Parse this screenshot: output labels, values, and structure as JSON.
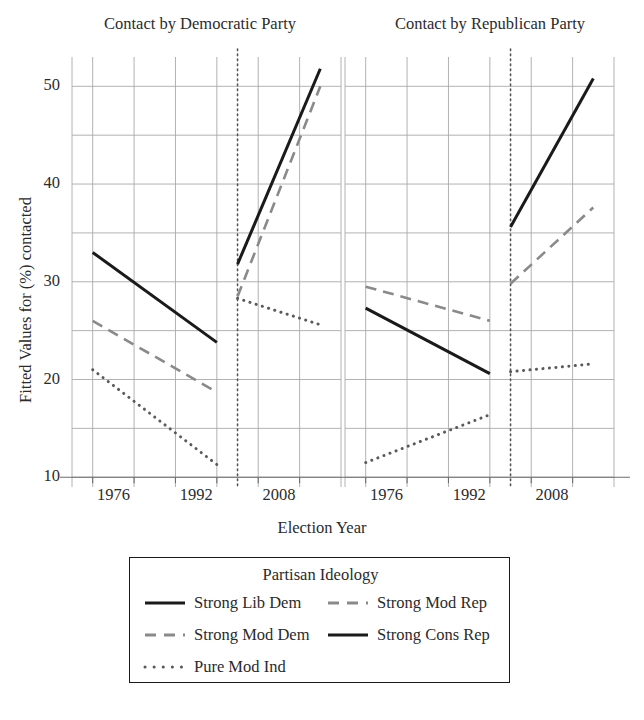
{
  "figure": {
    "panel_titles": [
      "Contact by Democratic Party",
      "Contact by Republican Party"
    ],
    "xlabel": "Election Year",
    "ylabel": "Fitted Values for (%) contacted",
    "ytick_labels": [
      "10",
      "20",
      "30",
      "40",
      "50"
    ],
    "xtick_labels_left": [
      "1976",
      "1992",
      "2008"
    ],
    "xtick_labels_right": [
      "1976",
      "1992",
      "2008"
    ]
  },
  "legend": {
    "title": "Partisan Ideology",
    "items": [
      {
        "label": "Strong Lib Dem",
        "style": "solid",
        "color": "#1a1a1a"
      },
      {
        "label": "Strong Mod Dem",
        "style": "dashed",
        "color": "#8a8a8a"
      },
      {
        "label": "Pure Mod Ind",
        "style": "dotted",
        "color": "#5a5a5a"
      },
      {
        "label": "Strong Mod Rep",
        "style": "dashed",
        "color": "#8a8a8a"
      },
      {
        "label": "Strong Cons Rep",
        "style": "solid",
        "color": "#1a1a1a"
      }
    ]
  },
  "chart_data": {
    "type": "line",
    "title": "",
    "xlabel": "Election Year",
    "ylabel": "Fitted Values for (%) contacted",
    "ylim": [
      9,
      53
    ],
    "ytick_values": [
      10,
      20,
      30,
      40,
      50
    ],
    "ygrid_values": [
      10,
      15,
      20,
      25,
      30,
      35,
      40,
      45,
      50
    ],
    "grid": true,
    "legend_position": "below",
    "facets": [
      {
        "name": "Contact by Democratic Party",
        "xlim": [
          1968,
          2020
        ],
        "xtick_values": [
          1976,
          1992,
          2008
        ],
        "period_break_x": 2000,
        "series": [
          {
            "name": "Strong Lib Dem",
            "style": "solid",
            "color": "#1a1a1a",
            "segments": [
              {
                "x": [
                  1972,
                  1996
                ],
                "y": [
                  33.0,
                  23.8
                ]
              },
              {
                "x": [
                  2000,
                  2016
                ],
                "y": [
                  31.8,
                  51.8
                ]
              }
            ]
          },
          {
            "name": "Strong Mod Dem",
            "style": "dashed",
            "color": "#8a8a8a",
            "segments": [
              {
                "x": [
                  1972,
                  1996
                ],
                "y": [
                  26.0,
                  18.7
                ]
              },
              {
                "x": [
                  2000,
                  2016
                ],
                "y": [
                  28.5,
                  50.0
                ]
              }
            ]
          },
          {
            "name": "Pure Mod Ind",
            "style": "dotted",
            "color": "#5a5a5a",
            "segments": [
              {
                "x": [
                  1972,
                  1996
                ],
                "y": [
                  21.0,
                  11.3
                ]
              },
              {
                "x": [
                  2000,
                  2016
                ],
                "y": [
                  28.3,
                  25.6
                ]
              }
            ]
          }
        ]
      },
      {
        "name": "Contact by Republican Party",
        "xlim": [
          1968,
          2020
        ],
        "xtick_values": [
          1976,
          1992,
          2008
        ],
        "period_break_x": 2000,
        "series": [
          {
            "name": "Strong Mod Rep",
            "style": "dashed",
            "color": "#8a8a8a",
            "segments": [
              {
                "x": [
                  1972,
                  1996
                ],
                "y": [
                  29.5,
                  26.0
                ]
              },
              {
                "x": [
                  2000,
                  2016
                ],
                "y": [
                  29.8,
                  37.6
                ]
              }
            ]
          },
          {
            "name": "Strong Cons Rep",
            "style": "solid",
            "color": "#1a1a1a",
            "segments": [
              {
                "x": [
                  1972,
                  1996
                ],
                "y": [
                  27.3,
                  20.6
                ]
              },
              {
                "x": [
                  2000,
                  2016
                ],
                "y": [
                  35.6,
                  50.8
                ]
              }
            ]
          },
          {
            "name": "Pure Mod Ind",
            "style": "dotted",
            "color": "#5a5a5a",
            "segments": [
              {
                "x": [
                  1972,
                  1996
                ],
                "y": [
                  11.5,
                  16.4
                ]
              },
              {
                "x": [
                  2000,
                  2016
                ],
                "y": [
                  20.8,
                  21.6
                ]
              }
            ]
          }
        ]
      }
    ]
  }
}
